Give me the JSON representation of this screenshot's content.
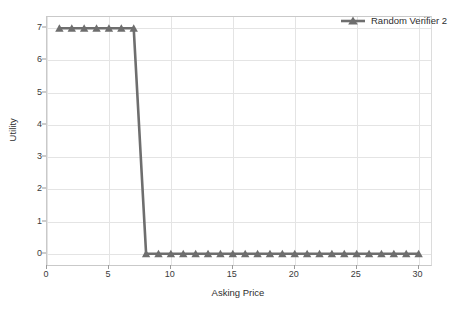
{
  "chart_data": {
    "type": "line",
    "title": "",
    "xlabel": "Asking Price",
    "ylabel": "Utility",
    "xlim": [
      0,
      31
    ],
    "ylim": [
      -0.35,
      7.35
    ],
    "xticks": [
      0,
      5,
      10,
      15,
      20,
      25,
      30
    ],
    "yticks": [
      0,
      1,
      2,
      3,
      4,
      5,
      6,
      7
    ],
    "grid": true,
    "legend_position": "top-right",
    "marker": "triangle-up",
    "line_color": "#6e6e6e",
    "series": [
      {
        "name": "Random Verifier 2",
        "color": "#6e6e6e",
        "x": [
          1,
          2,
          3,
          4,
          5,
          6,
          7,
          8,
          9,
          10,
          11,
          12,
          13,
          14,
          15,
          16,
          17,
          18,
          19,
          20,
          21,
          22,
          23,
          24,
          25,
          26,
          27,
          28,
          29,
          30
        ],
        "values": [
          7,
          7,
          7,
          7,
          7,
          7,
          7,
          0,
          0,
          0,
          0,
          0,
          0,
          0,
          0,
          0,
          0,
          0,
          0,
          0,
          0,
          0,
          0,
          0,
          0,
          0,
          0,
          0,
          0,
          0
        ]
      }
    ]
  },
  "legend": {
    "entries": [
      {
        "label": "Random Verifier 2",
        "color": "#6e6e6e"
      }
    ]
  },
  "axes": {
    "x_title": "Asking Price",
    "y_title": "Utility",
    "x_tick_labels": [
      "0",
      "5",
      "10",
      "15",
      "20",
      "25",
      "30"
    ],
    "y_tick_labels": [
      "0",
      "1",
      "2",
      "3",
      "4",
      "5",
      "6",
      "7"
    ]
  },
  "colors": {
    "series": "#6e6e6e",
    "grid": "#e4e4e4",
    "axis": "#c9c9c9",
    "text": "#2e2e2e",
    "background": "#ffffff"
  }
}
